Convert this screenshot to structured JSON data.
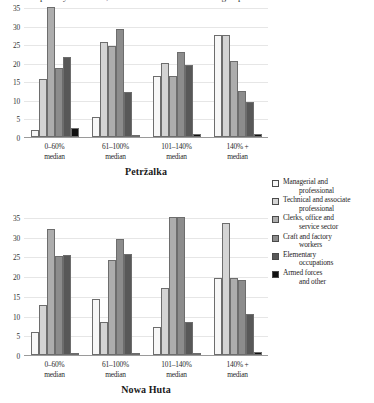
{
  "caption": {
    "text": "in relative poverty risk levels, education and socio-economic groups"
  },
  "legend": {
    "position": "right",
    "items": [
      {
        "label_line1": "Managerial and",
        "label_line2": "professional",
        "color": "#f7f7f7"
      },
      {
        "label_line1": "Technical and associate",
        "label_line2": "professional",
        "color": "#d4d4d4"
      },
      {
        "label_line1": "Clerks, office and",
        "label_line2": "service sector",
        "color": "#adadad"
      },
      {
        "label_line1": "Craft and factory",
        "label_line2": "workers",
        "color": "#8c8c8c"
      },
      {
        "label_line1": "Elementary",
        "label_line2": "occupations",
        "color": "#585858"
      },
      {
        "label_line1": "Armed forces",
        "label_line2": "and other",
        "color": "#111111"
      }
    ]
  },
  "chart_data": [
    {
      "type": "bar",
      "title": "Petržalka",
      "xlabel": "",
      "ylabel": "",
      "ylim": [
        0,
        35
      ],
      "yticks": [
        0,
        5,
        10,
        15,
        20,
        25,
        30,
        35
      ],
      "grid": true,
      "categories": [
        "0–60%\nmedian",
        "61–100%\nmedian",
        "101–140%\nmedian",
        "140% +\nmedian"
      ],
      "categories_display": [
        {
          "line1": "0–60%",
          "line2": "median"
        },
        {
          "line1": "61–100%",
          "line2": "median"
        },
        {
          "line1": "101–140%",
          "line2": "median"
        },
        {
          "line1": "140% +",
          "line2": "median"
        }
      ],
      "series": [
        {
          "name": "Managerial and professional",
          "color": "#f7f7f7",
          "values": [
            2.0,
            5.5,
            16.5,
            27.5
          ]
        },
        {
          "name": "Technical and associate professional",
          "color": "#d4d4d4",
          "values": [
            15.5,
            25.5,
            20.0,
            27.5
          ]
        },
        {
          "name": "Clerks, office and service sector",
          "color": "#adadad",
          "values": [
            35.0,
            24.5,
            16.5,
            20.5
          ]
        },
        {
          "name": "Craft and factory workers",
          "color": "#8c8c8c",
          "values": [
            18.5,
            29.0,
            23.0,
            12.5
          ]
        },
        {
          "name": "Elementary occupations",
          "color": "#585858",
          "values": [
            21.5,
            12.0,
            19.5,
            9.5
          ]
        },
        {
          "name": "Armed forces and other",
          "color": "#111111",
          "values": [
            2.5,
            0.5,
            0.8,
            0.8
          ]
        }
      ]
    },
    {
      "type": "bar",
      "title": "Nowa Huta",
      "xlabel": "",
      "ylabel": "",
      "ylim": [
        0,
        35
      ],
      "yticks": [
        0,
        5,
        10,
        15,
        20,
        25,
        30,
        35
      ],
      "grid": true,
      "categories": [
        "0–60%\nmedian",
        "61–100%\nmedian",
        "101–140%\nmedian",
        "140% +\nmedian"
      ],
      "categories_display": [
        {
          "line1": "0–60%",
          "line2": "median"
        },
        {
          "line1": "61–100%",
          "line2": "median"
        },
        {
          "line1": "101–140%",
          "line2": "median"
        },
        {
          "line1": "140% +",
          "line2": "median"
        }
      ],
      "series": [
        {
          "name": "Managerial and professional",
          "color": "#f7f7f7",
          "values": [
            5.8,
            14.3,
            7.0,
            19.5
          ]
        },
        {
          "name": "Technical and associate professional",
          "color": "#d4d4d4",
          "values": [
            12.7,
            8.5,
            17.0,
            33.5
          ]
        },
        {
          "name": "Clerks, office and service sector",
          "color": "#adadad",
          "values": [
            32.0,
            24.0,
            35.0,
            19.5
          ]
        },
        {
          "name": "Craft and factory workers",
          "color": "#8c8c8c",
          "values": [
            25.2,
            29.5,
            35.0,
            19.0
          ]
        },
        {
          "name": "Elementary occupations",
          "color": "#585858",
          "values": [
            25.3,
            25.5,
            8.5,
            10.5
          ]
        },
        {
          "name": "Armed forces and other",
          "color": "#111111",
          "values": [
            0.0,
            0.0,
            0.0,
            0.8
          ]
        }
      ]
    }
  ]
}
